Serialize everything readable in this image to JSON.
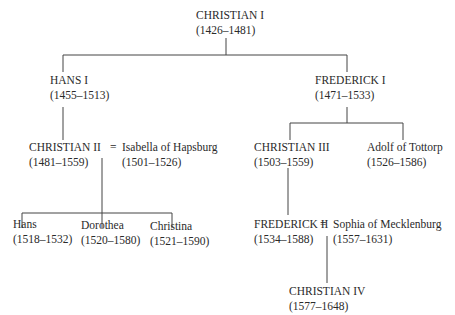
{
  "diagram": {
    "type": "family-tree",
    "nodes": {
      "christian_i": {
        "name": "CHRISTIAN I",
        "dates": "(1426–1481)"
      },
      "hans_i": {
        "name": "HANS I",
        "dates": "(1455–1513)"
      },
      "frederick_i": {
        "name": "FREDERICK I",
        "dates": "(1471–1533)"
      },
      "christian_ii": {
        "name": "CHRISTIAN II",
        "dates": "(1481–1559)"
      },
      "isabella": {
        "name": "Isabella of Hapsburg",
        "dates": "(1501–1526)"
      },
      "christian_iii": {
        "name": "CHRISTIAN III",
        "dates": "(1503–1559)"
      },
      "adolf": {
        "name": "Adolf of Tottorp",
        "dates": "(1526–1586)"
      },
      "hans": {
        "name": "Hans",
        "dates": "(1518–1532)"
      },
      "dorothea": {
        "name": "Dorothea",
        "dates": "(1520–1580)"
      },
      "christina": {
        "name": "Christina",
        "dates": "(1521–1590)"
      },
      "frederick_ii": {
        "name": "FREDERICK II",
        "dates": "(1534–1588)"
      },
      "sophia": {
        "name": "Sophia of Mecklenburg",
        "dates": "(1557–1631)"
      },
      "christian_iv": {
        "name": "CHRISTIAN IV",
        "dates": "(1577–1648)"
      }
    },
    "marriage_symbol": " = ",
    "edges": [
      [
        "christian_i",
        "hans_i"
      ],
      [
        "christian_i",
        "frederick_i"
      ],
      [
        "hans_i",
        "christian_ii"
      ],
      [
        "christian_ii+isabella",
        "hans"
      ],
      [
        "christian_ii+isabella",
        "dorothea"
      ],
      [
        "christian_ii+isabella",
        "christina"
      ],
      [
        "frederick_i",
        "christian_iii"
      ],
      [
        "frederick_i",
        "adolf"
      ],
      [
        "christian_iii",
        "frederick_ii"
      ],
      [
        "frederick_ii+sophia",
        "christian_iv"
      ]
    ]
  }
}
